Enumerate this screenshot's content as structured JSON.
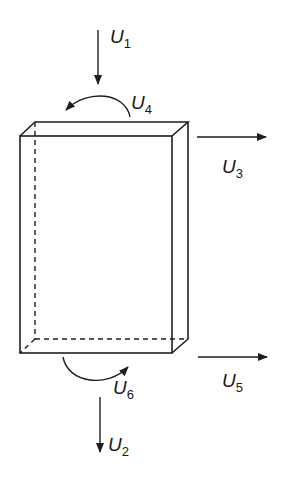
{
  "diagram": {
    "type": "box-with-displacement-arrows",
    "labels": {
      "u1": {
        "main": "U",
        "sub": "1"
      },
      "u2": {
        "main": "U",
        "sub": "2"
      },
      "u3": {
        "main": "U",
        "sub": "3"
      },
      "u4": {
        "main": "U",
        "sub": "4"
      },
      "u5": {
        "main": "U",
        "sub": "5"
      },
      "u6": {
        "main": "U",
        "sub": "6"
      }
    },
    "colors": {
      "stroke": "#1e1e1e",
      "background": "#ffffff"
    }
  }
}
